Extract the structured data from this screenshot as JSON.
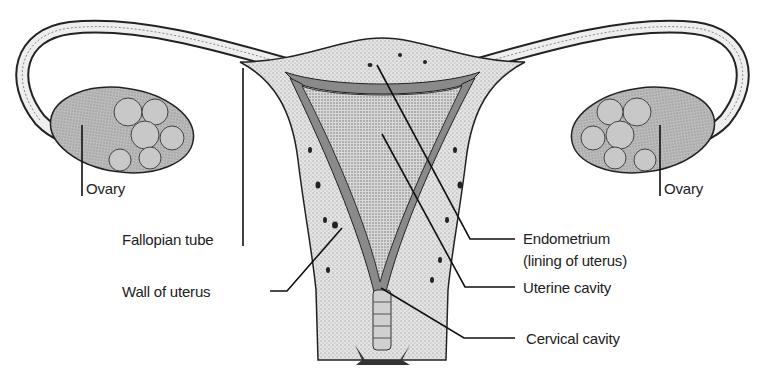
{
  "diagram": {
    "colors": {
      "background": "#ffffff",
      "tissue_light": "#e2e2e2",
      "tissue_mid": "#c4c4c4",
      "lining_dark": "#8a8a8a",
      "outline": "#222222",
      "label_text": "#222222"
    },
    "labels": {
      "ovary_left": "Ovary",
      "ovary_right": "Ovary",
      "fallopian_tube": "Fallopian tube",
      "wall_of_uterus": "Wall of uterus",
      "endometrium_line1": "Endometrium",
      "endometrium_line2": "(lining of uterus)",
      "uterine_cavity": "Uterine cavity",
      "cervical_cavity": "Cervical cavity"
    }
  }
}
